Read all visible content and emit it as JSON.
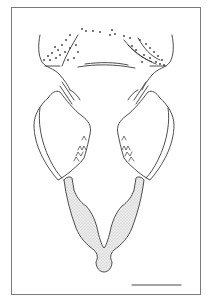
{
  "figure": {
    "type": "scientific-line-drawing",
    "frame": {
      "x": 11,
      "y": 7,
      "width": 190,
      "height": 288,
      "color": "#7a7a7a"
    },
    "scale_bar": {
      "x1": 132,
      "x2": 181,
      "y": 285,
      "label": ""
    },
    "colors": {
      "line": "#3a3a3a",
      "stipple": "#d9d9d9",
      "background": "#ffffff"
    }
  }
}
